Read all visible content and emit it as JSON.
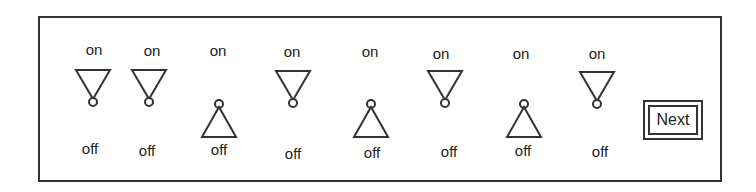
{
  "panel": {
    "switches": [
      {
        "id": 1,
        "on_label": "on",
        "off_label": "off",
        "state": "on"
      },
      {
        "id": 2,
        "on_label": "on",
        "off_label": "off",
        "state": "on"
      },
      {
        "id": 3,
        "on_label": "on",
        "off_label": "off",
        "state": "off"
      },
      {
        "id": 4,
        "on_label": "on",
        "off_label": "off",
        "state": "on"
      },
      {
        "id": 5,
        "on_label": "on",
        "off_label": "off",
        "state": "off"
      },
      {
        "id": 6,
        "on_label": "on",
        "off_label": "off",
        "state": "on"
      },
      {
        "id": 7,
        "on_label": "on",
        "off_label": "off",
        "state": "off"
      },
      {
        "id": 8,
        "on_label": "on",
        "off_label": "off",
        "state": "on"
      }
    ],
    "next_button": {
      "label": "Next"
    }
  },
  "colors": {
    "stroke": "#333333",
    "background": "#ffffff",
    "text": "#222222"
  }
}
